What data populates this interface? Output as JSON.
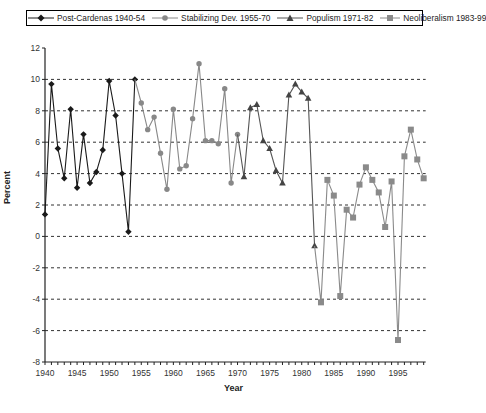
{
  "chart_data": {
    "type": "line",
    "title": "",
    "xlabel": "Year",
    "ylabel": "Percent",
    "xlim": [
      1940,
      1999
    ],
    "ylim": [
      -8,
      12
    ],
    "x_ticks": [
      "1940",
      "1945",
      "1950",
      "1955",
      "1960",
      "1965",
      "1970",
      "1975",
      "1980",
      "1985",
      "1990",
      "1995"
    ],
    "y_ticks": [
      "12",
      "10",
      "8",
      "6",
      "4",
      "2",
      "0",
      "-2",
      "-4",
      "-6",
      "-8"
    ],
    "grid": "horizontal dashed",
    "legend_position": "top",
    "values_note": "Approximate: point values were read off the full-resolution overview and snapped roughly to the gridlines; expect +/-0.3 to 0.5 points, more where markers crowd together.",
    "series": [
      {
        "name": "Post-Cardenas 1940-54",
        "color": "#1a1a1a",
        "marker": "diamond",
        "x": [
          1940,
          1941,
          1942,
          1943,
          1944,
          1945,
          1946,
          1947,
          1948,
          1949,
          1950,
          1951,
          1952,
          1953,
          1954
        ],
        "values": [
          1.4,
          9.7,
          5.6,
          3.7,
          8.1,
          3.1,
          6.5,
          3.4,
          4.1,
          5.5,
          9.9,
          7.7,
          4.0,
          0.3,
          10.0
        ]
      },
      {
        "name": "Stabilizing Dev. 1955-70",
        "color": "#888888",
        "marker": "circle",
        "x": [
          1954,
          1955,
          1956,
          1957,
          1958,
          1959,
          1960,
          1961,
          1962,
          1963,
          1964,
          1965,
          1966,
          1967,
          1968,
          1969,
          1970
        ],
        "values": [
          10.0,
          8.5,
          6.8,
          7.6,
          5.3,
          3.0,
          8.1,
          4.3,
          4.5,
          7.5,
          11.0,
          6.1,
          6.1,
          5.9,
          9.4,
          3.4,
          6.5
        ]
      },
      {
        "name": "Populism 1971-82",
        "color": "#555555",
        "marker": "triangle",
        "x": [
          1970,
          1971,
          1972,
          1973,
          1974,
          1975,
          1976,
          1977,
          1978,
          1979,
          1980,
          1981,
          1982
        ],
        "values": [
          6.5,
          3.8,
          8.2,
          8.4,
          6.1,
          5.6,
          4.2,
          3.4,
          9.0,
          9.7,
          9.2,
          8.8,
          -0.6
        ]
      },
      {
        "name": "Neoliberalism 1983-99",
        "color": "#8a8a8a",
        "marker": "square",
        "x": [
          1982,
          1983,
          1984,
          1985,
          1986,
          1987,
          1988,
          1989,
          1990,
          1991,
          1992,
          1993,
          1994,
          1995,
          1996,
          1997,
          1998,
          1999
        ],
        "values": [
          -0.6,
          -4.2,
          3.6,
          2.6,
          -3.8,
          1.7,
          1.2,
          3.3,
          4.4,
          3.6,
          2.8,
          0.6,
          3.5,
          -6.6,
          5.1,
          6.8,
          4.9,
          3.7
        ]
      }
    ]
  }
}
